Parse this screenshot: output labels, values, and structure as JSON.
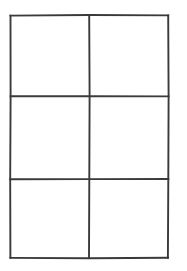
{
  "page": {
    "background_color": "#ffffff",
    "width": 187,
    "height": 271
  },
  "grid": {
    "name": "blank-2x3-grid",
    "columns": 2,
    "rows": 3,
    "cell_count": 6,
    "line_color": "#3a3a3a",
    "line_width": 2,
    "style": "hand-drawn-scanned",
    "bounds": {
      "left": 10,
      "top": 15,
      "right": 168,
      "bottom": 258
    },
    "vertical_dividers_x": [
      89
    ],
    "horizontal_dividers_y": [
      96,
      179
    ],
    "cells": [
      {
        "id": "cell-r1-c1",
        "row": 1,
        "col": 1,
        "label": "",
        "x": 10,
        "y": 15,
        "width": 79,
        "height": 81
      },
      {
        "id": "cell-r1-c2",
        "row": 1,
        "col": 2,
        "label": "",
        "x": 89,
        "y": 15,
        "width": 79,
        "height": 81
      },
      {
        "id": "cell-r2-c1",
        "row": 2,
        "col": 1,
        "label": "",
        "x": 10,
        "y": 96,
        "width": 79,
        "height": 83
      },
      {
        "id": "cell-r2-c2",
        "row": 2,
        "col": 2,
        "label": "",
        "x": 89,
        "y": 96,
        "width": 79,
        "height": 83
      },
      {
        "id": "cell-r3-c1",
        "row": 3,
        "col": 1,
        "label": "",
        "x": 10,
        "y": 179,
        "width": 79,
        "height": 79
      },
      {
        "id": "cell-r3-c2",
        "row": 3,
        "col": 2,
        "label": "",
        "x": 89,
        "y": 179,
        "width": 79,
        "height": 79
      }
    ]
  }
}
